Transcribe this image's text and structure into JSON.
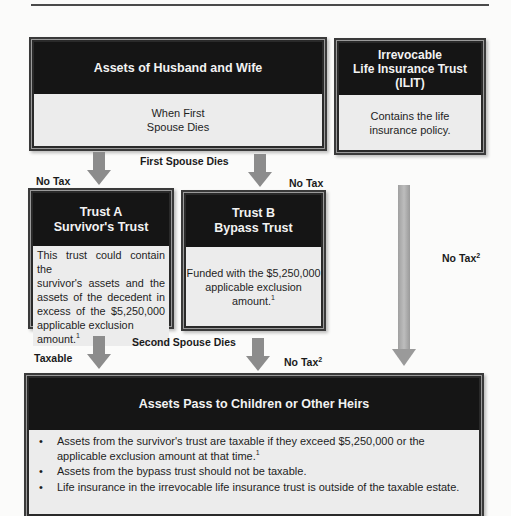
{
  "top_box": {
    "title": "Assets of Husband and Wife",
    "body_line1": "When First",
    "body_line2": "Spouse Dies"
  },
  "ilit_box": {
    "title_line1": "Irrevocable",
    "title_line2": "Life Insurance Trust",
    "title_line3": "(ILIT)",
    "body_line1": "Contains the life",
    "body_line2": "insurance policy."
  },
  "labels": {
    "first_spouse_dies": "First Spouse Dies",
    "no_tax_left": "No Tax",
    "no_tax_right": "No Tax",
    "ilit_no_tax": "No Tax",
    "ilit_no_tax_sup": "2",
    "second_spouse_dies": "Second Spouse Dies",
    "taxable": "Taxable",
    "bypass_no_tax": "No Tax",
    "bypass_no_tax_sup": "2"
  },
  "trust_a": {
    "title_line1": "Trust A",
    "title_line2": "Survivor's Trust",
    "body_lines": [
      "This trust could contain the",
      "survivor's assets and the",
      "assets of the decedent in",
      "excess of the $5,250,000"
    ],
    "body_last": "applicable exclusion amount.",
    "body_sup": "1"
  },
  "trust_b": {
    "title_line1": "Trust B",
    "title_line2": "Bypass Trust",
    "body_line1": "Funded with the $5,250,000",
    "body_line2": "applicable exclusion amount.",
    "body_sup": "1"
  },
  "heirs_box": {
    "title": "Assets Pass to Children or Other Heirs",
    "bullets": [
      {
        "text": "Assets from the survivor's trust are taxable if they exceed $5,250,000 or the applicable exclusion amount at that time.",
        "sup": "1"
      },
      {
        "text": "Assets from the bypass trust should not be taxable.",
        "sup": ""
      },
      {
        "text": "Life insurance in the irrevocable life insurance trust is outside of the taxable estate.",
        "sup": ""
      }
    ]
  },
  "colors": {
    "header_bg": "#151515",
    "body_bg": "#ececec",
    "arrow": "#8c8c8c"
  }
}
